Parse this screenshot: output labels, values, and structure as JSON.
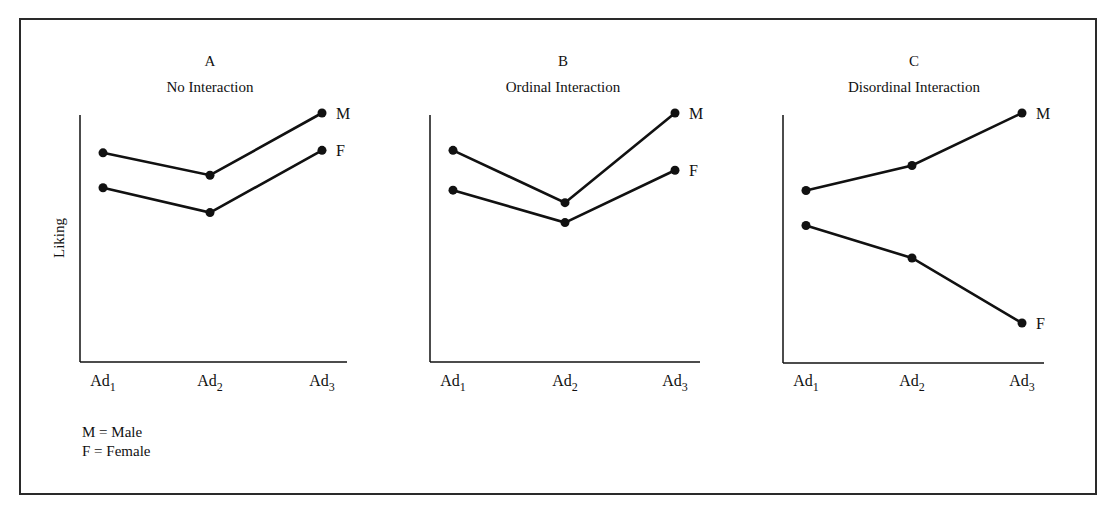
{
  "chart_data": [
    {
      "type": "line",
      "panel": "A",
      "title": "No Interaction",
      "xlabel": "",
      "ylabel": "Liking",
      "categories": [
        "Ad1",
        "Ad2",
        "Ad3"
      ],
      "ylim": [
        0,
        10
      ],
      "series": [
        {
          "name": "M",
          "values": [
            8.4,
            7.5,
            10.0
          ]
        },
        {
          "name": "F",
          "values": [
            7.0,
            6.0,
            8.5
          ]
        }
      ]
    },
    {
      "type": "line",
      "panel": "B",
      "title": "Ordinal Interaction",
      "xlabel": "",
      "ylabel": "",
      "categories": [
        "Ad1",
        "Ad2",
        "Ad3"
      ],
      "ylim": [
        0,
        10
      ],
      "series": [
        {
          "name": "M",
          "values": [
            8.5,
            6.4,
            10.0
          ]
        },
        {
          "name": "F",
          "values": [
            6.9,
            5.6,
            7.7
          ]
        }
      ]
    },
    {
      "type": "line",
      "panel": "C",
      "title": "Disordinal Interaction",
      "xlabel": "",
      "ylabel": "",
      "categories": [
        "Ad1",
        "Ad2",
        "Ad3"
      ],
      "ylim": [
        0,
        10
      ],
      "series": [
        {
          "name": "M",
          "values": [
            6.9,
            7.9,
            10.0
          ]
        },
        {
          "name": "F",
          "values": [
            5.5,
            4.2,
            1.6
          ]
        }
      ]
    }
  ],
  "legend": {
    "entries": [
      "M = Male",
      "F = Female"
    ]
  },
  "colors": {
    "ink": "#111111",
    "background": "#ffffff"
  }
}
